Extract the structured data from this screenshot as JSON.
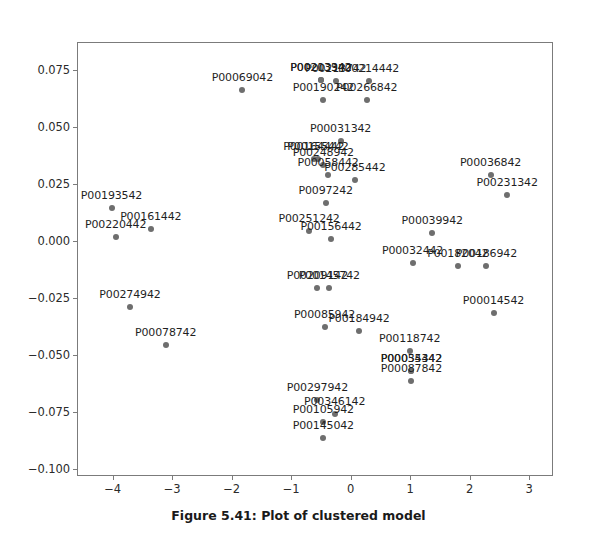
{
  "caption": "Figure 5.41: Plot of clustered model",
  "colors": {
    "point": "#6e6e6e",
    "axis": "#7b7b7b",
    "text": "#1f1f1f",
    "background": "#ffffff"
  },
  "chart_data": {
    "type": "scatter",
    "title": "",
    "subtitle": "",
    "xlabel": "",
    "ylabel": "",
    "xlim": [
      -4.6,
      3.4
    ],
    "ylim": [
      -0.103,
      0.0875
    ],
    "grid": false,
    "legend": false,
    "legend_position": "none",
    "xticks": [
      -4,
      -3,
      -2,
      -1,
      0,
      1,
      2,
      3
    ],
    "xtick_labels": [
      "−4",
      "−3",
      "−2",
      "−1",
      "0",
      "1",
      "2",
      "3"
    ],
    "yticks": [
      0.075,
      0.05,
      0.025,
      0.0,
      -0.025,
      -0.05,
      -0.075,
      -0.1
    ],
    "ytick_labels": [
      "0.075",
      "0.050",
      "0.025",
      "0.000",
      "−0.025",
      "−0.050",
      "−0.075",
      "−0.100"
    ],
    "marker": "circle",
    "marker_color": "#6e6e6e",
    "points": [
      {
        "label": "P00069042",
        "x": -1.82,
        "y": 0.0665
      },
      {
        "label": "P00203342",
        "x": -0.5,
        "y": 0.071
      },
      {
        "label": "P00213942",
        "x": -0.5,
        "y": 0.071
      },
      {
        "label": "P00213742",
        "x": -0.25,
        "y": 0.0705
      },
      {
        "label": "P00214442",
        "x": 0.3,
        "y": 0.0705
      },
      {
        "label": "P00190242",
        "x": -0.46,
        "y": 0.062
      },
      {
        "label": "P00266842",
        "x": 0.27,
        "y": 0.062
      },
      {
        "label": "P00031342",
        "x": -0.17,
        "y": 0.044
      },
      {
        "label": "P00164442",
        "x": -0.62,
        "y": 0.036
      },
      {
        "label": "P00155442",
        "x": -0.55,
        "y": 0.036
      },
      {
        "label": "P00248942",
        "x": -0.46,
        "y": 0.0335
      },
      {
        "label": "P00058442",
        "x": -0.38,
        "y": 0.029
      },
      {
        "label": "P00285442",
        "x": 0.07,
        "y": 0.027
      },
      {
        "label": "P00036842",
        "x": 2.35,
        "y": 0.029
      },
      {
        "label": "P00231342",
        "x": 2.63,
        "y": 0.0205
      },
      {
        "label": "P0097242",
        "x": -0.42,
        "y": 0.017
      },
      {
        "label": "P00193542",
        "x": -4.02,
        "y": 0.0145
      },
      {
        "label": "P00161442",
        "x": -3.36,
        "y": 0.0055
      },
      {
        "label": "P00220442",
        "x": -3.95,
        "y": 0.002
      },
      {
        "label": "P00251242",
        "x": -0.7,
        "y": 0.0045
      },
      {
        "label": "P00156442",
        "x": -0.33,
        "y": 0.001
      },
      {
        "label": "P00039942",
        "x": 1.37,
        "y": 0.0035
      },
      {
        "label": "P00032442",
        "x": 1.04,
        "y": -0.0095
      },
      {
        "label": "P00182042",
        "x": 1.8,
        "y": -0.011
      },
      {
        "label": "P00186942",
        "x": 2.28,
        "y": -0.011
      },
      {
        "label": "P00209142",
        "x": -0.56,
        "y": -0.0205
      },
      {
        "label": "P00145742",
        "x": -0.36,
        "y": -0.0205
      },
      {
        "label": "P00274942",
        "x": -3.71,
        "y": -0.029
      },
      {
        "label": "P00014542",
        "x": 2.4,
        "y": -0.0315
      },
      {
        "label": "P00085942",
        "x": -0.44,
        "y": -0.0375
      },
      {
        "label": "P00184942",
        "x": 0.14,
        "y": -0.0395
      },
      {
        "label": "P00078742",
        "x": -3.11,
        "y": -0.0455
      },
      {
        "label": "P00118742",
        "x": 0.99,
        "y": -0.048
      },
      {
        "label": "P00035442",
        "x": 1.02,
        "y": -0.057
      },
      {
        "label": "P00054342",
        "x": 1.02,
        "y": -0.057
      },
      {
        "label": "P00087842",
        "x": 1.02,
        "y": -0.0615
      },
      {
        "label": "P00297942",
        "x": -0.56,
        "y": -0.0695
      },
      {
        "label": "P00346142",
        "x": -0.27,
        "y": -0.076
      },
      {
        "label": "P00105942",
        "x": -0.46,
        "y": -0.0795
      },
      {
        "label": "P00145042",
        "x": -0.46,
        "y": -0.0865
      }
    ]
  }
}
